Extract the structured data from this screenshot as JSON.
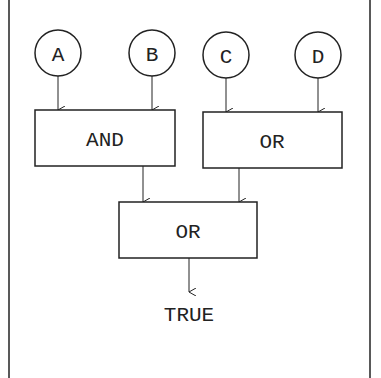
{
  "diagram": {
    "inputs": [
      {
        "label": "A"
      },
      {
        "label": "B"
      },
      {
        "label": "C"
      },
      {
        "label": "D"
      }
    ],
    "gates": [
      {
        "label": "AND",
        "inputs": [
          "A",
          "B"
        ]
      },
      {
        "label": "OR",
        "inputs": [
          "C",
          "D"
        ]
      },
      {
        "label": "OR",
        "inputs": [
          "AND",
          "OR"
        ]
      }
    ],
    "output": {
      "label": "TRUE"
    },
    "colors": {
      "stroke": "#222222",
      "background": "#ffffff"
    }
  }
}
